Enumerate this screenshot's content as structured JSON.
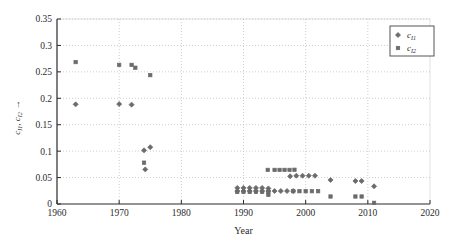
{
  "chart_data": {
    "type": "scatter",
    "title": "",
    "xlabel": "Year",
    "ylabel": "c_I1, c_I2",
    "ylabel_arrow": "→",
    "xlim": [
      1960,
      2020
    ],
    "ylim": [
      0,
      0.35
    ],
    "xticks": [
      1960,
      1970,
      1980,
      1990,
      2000,
      2010,
      2020
    ],
    "xtick_labels": [
      "1960",
      "1970",
      "1980",
      "1990",
      "2000",
      "2010",
      "2020"
    ],
    "yticks": [
      0,
      0.05,
      0.1,
      0.15,
      0.2,
      0.25,
      0.3,
      0.35
    ],
    "ytick_labels": [
      "0",
      "0.05",
      "0.1",
      "0.15",
      "0.2",
      "0.25",
      "0.3",
      "0.35"
    ],
    "grid": true,
    "grid_style": "dotted",
    "legend_position": "top-right",
    "marker_color": "#6b6b6b",
    "axis_color": "#2b2b2b",
    "grid_color": "#b8b8b8",
    "series": [
      {
        "name": "c_I1",
        "name_base": "c",
        "name_sub": "I1",
        "marker": "diamond",
        "color": "#6b6b6b",
        "points": [
          [
            1963.0,
            0.1885
          ],
          [
            1970.0,
            0.189
          ],
          [
            1972.0,
            0.188
          ],
          [
            1974.0,
            0.1015
          ],
          [
            1974.2,
            0.0655
          ],
          [
            1975.0,
            0.1075
          ],
          [
            1989.0,
            0.0305
          ],
          [
            1990.0,
            0.0305
          ],
          [
            1991.0,
            0.0305
          ],
          [
            1992.0,
            0.0305
          ],
          [
            1993.0,
            0.0305
          ],
          [
            1994.0,
            0.0295
          ],
          [
            1989.0,
            0.0245
          ],
          [
            1990.0,
            0.0245
          ],
          [
            1991.0,
            0.0245
          ],
          [
            1992.0,
            0.0245
          ],
          [
            1993.0,
            0.0245
          ],
          [
            1994.0,
            0.0245
          ],
          [
            1995.0,
            0.0245
          ],
          [
            1996.0,
            0.0245
          ],
          [
            1997.0,
            0.0245
          ],
          [
            1998.0,
            0.0245
          ],
          [
            1997.5,
            0.0525
          ],
          [
            1998.5,
            0.0535
          ],
          [
            1999.5,
            0.0535
          ],
          [
            2000.5,
            0.0535
          ],
          [
            2001.5,
            0.0535
          ],
          [
            2004.0,
            0.0455
          ],
          [
            2008.0,
            0.0435
          ],
          [
            2009.0,
            0.0435
          ],
          [
            2011.0,
            0.0335
          ]
        ]
      },
      {
        "name": "c_I2",
        "name_base": "c",
        "name_sub": "I2",
        "marker": "square",
        "color": "#6b6b6b",
        "points": [
          [
            1963.0,
            0.2685
          ],
          [
            1970.0,
            0.2632
          ],
          [
            1972.0,
            0.2632
          ],
          [
            1972.6,
            0.2578
          ],
          [
            1975.0,
            0.2438
          ],
          [
            1974.0,
            0.0782
          ],
          [
            1989.0,
            0.0228
          ],
          [
            1990.0,
            0.0228
          ],
          [
            1991.0,
            0.0228
          ],
          [
            1992.0,
            0.0228
          ],
          [
            1993.0,
            0.0228
          ],
          [
            1994.0,
            0.0228
          ],
          [
            1994.0,
            0.0172
          ],
          [
            1993.9,
            0.0645
          ],
          [
            1995.0,
            0.0645
          ],
          [
            1995.8,
            0.0645
          ],
          [
            1996.6,
            0.0645
          ],
          [
            1997.4,
            0.0645
          ],
          [
            1998.2,
            0.0648
          ],
          [
            1998.0,
            0.0242
          ],
          [
            1999.0,
            0.0242
          ],
          [
            2000.0,
            0.0242
          ],
          [
            2001.0,
            0.0242
          ],
          [
            2002.0,
            0.0242
          ],
          [
            2004.0,
            0.0142
          ],
          [
            2008.0,
            0.0142
          ],
          [
            2009.0,
            0.0142
          ],
          [
            2011.0,
            0.0022
          ]
        ]
      }
    ]
  }
}
